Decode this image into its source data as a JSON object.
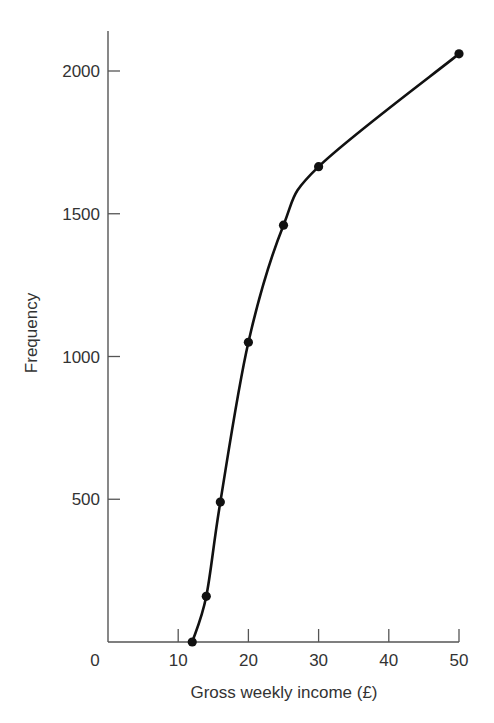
{
  "chart_data": {
    "type": "line",
    "title": "",
    "xlabel": "Gross weekly income (£)",
    "ylabel": "Frequency",
    "xlim": [
      0,
      50
    ],
    "ylim": [
      0,
      2150
    ],
    "x_ticks": [
      10,
      20,
      30,
      40,
      50
    ],
    "y_ticks": [
      500,
      1000,
      1500,
      2000
    ],
    "origin_label": "0",
    "grid": false,
    "legend": null,
    "series": [
      {
        "name": "Cumulative frequency",
        "smooth": true,
        "markers": true,
        "x": [
          12,
          14,
          16,
          20,
          25,
          30,
          50
        ],
        "y": [
          0,
          160,
          490,
          1050,
          1460,
          1665,
          2060
        ]
      }
    ]
  },
  "colors": {
    "axis": "#555555",
    "curve": "#111111",
    "text": "#333333"
  }
}
